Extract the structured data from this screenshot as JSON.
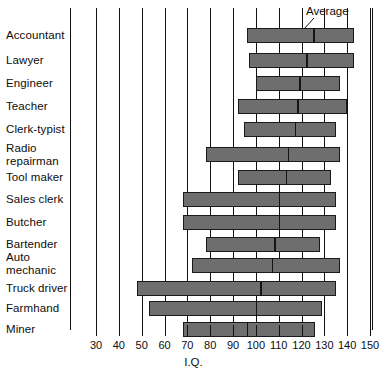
{
  "chart": {
    "axis_title": "I.Q.",
    "average_annotation": "Average"
  },
  "chart_data": {
    "type": "bar",
    "subtype": "horizontal-range-bar",
    "title": "",
    "subtitle": "",
    "xlabel": "I.Q.",
    "ylabel": "",
    "xlim": [
      30,
      150
    ],
    "xticks": [
      30,
      40,
      50,
      60,
      70,
      80,
      90,
      100,
      110,
      120,
      130,
      140,
      150
    ],
    "xtick_labels": [
      "30",
      "40",
      "50",
      "60",
      "70",
      "80",
      "90",
      "100",
      "110",
      "120",
      "130",
      "140",
      "150"
    ],
    "grid": true,
    "grid_axis": "x",
    "legend": false,
    "annotations": [
      {
        "text": "Average",
        "points_to": "average tick mark on Accountant bar"
      }
    ],
    "bar_color": "#6e6e6e",
    "bar_edge_color": "#1a1a1a",
    "categories": [
      "Accountant",
      "Lawyer",
      "Engineer",
      "Teacher",
      "Clerk-typist",
      "Radio\nrepairman",
      "Tool maker",
      "Sales clerk",
      "Butcher",
      "Bartender",
      "Auto\nmechanic",
      "Truck driver",
      "Farmhand",
      "Miner"
    ],
    "series": [
      {
        "name": "I.Q. range",
        "low": [
          96,
          97,
          100,
          92,
          95,
          78,
          92,
          68,
          68,
          78,
          72,
          48,
          53,
          68
        ],
        "high": [
          143,
          143,
          137,
          140,
          135,
          137,
          133,
          135,
          135,
          128,
          137,
          135,
          129,
          126
        ],
        "average": [
          125,
          122,
          119,
          118,
          117,
          114,
          113,
          110,
          110,
          108,
          107,
          102,
          100,
          96
        ]
      }
    ],
    "rows": [
      {
        "category": "Accountant",
        "low": 96,
        "high": 143,
        "average": 125
      },
      {
        "category": "Lawyer",
        "low": 97,
        "high": 143,
        "average": 122
      },
      {
        "category": "Engineer",
        "low": 100,
        "high": 137,
        "average": 119
      },
      {
        "category": "Teacher",
        "low": 92,
        "high": 140,
        "average": 118
      },
      {
        "category": "Clerk-typist",
        "low": 95,
        "high": 135,
        "average": 117
      },
      {
        "category": "Radio repairman",
        "low": 78,
        "high": 137,
        "average": 114
      },
      {
        "category": "Tool maker",
        "low": 92,
        "high": 133,
        "average": 113
      },
      {
        "category": "Sales clerk",
        "low": 68,
        "high": 135,
        "average": 110
      },
      {
        "category": "Butcher",
        "low": 68,
        "high": 135,
        "average": 110
      },
      {
        "category": "Bartender",
        "low": 78,
        "high": 128,
        "average": 108
      },
      {
        "category": "Auto mechanic",
        "low": 72,
        "high": 137,
        "average": 107
      },
      {
        "category": "Truck driver",
        "low": 48,
        "high": 135,
        "average": 102
      },
      {
        "category": "Farmhand",
        "low": 53,
        "high": 129,
        "average": 100
      },
      {
        "category": "Miner",
        "low": 68,
        "high": 126,
        "average": 96
      }
    ]
  },
  "layout": {
    "plot_left_px": 70,
    "plot_right_px": 373,
    "plot_top_px": 8,
    "plot_bottom_px": 330,
    "x_min_px": 96,
    "x_max_px": 370,
    "row_tops_px": [
      28,
      53,
      76,
      99,
      122,
      147,
      170,
      192,
      215,
      237,
      258,
      281,
      301,
      322
    ],
    "label_tops_px": [
      29,
      54,
      77,
      100,
      123,
      142,
      171,
      193,
      216,
      238,
      251,
      282,
      302,
      323
    ]
  }
}
